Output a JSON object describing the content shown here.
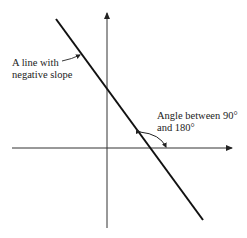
{
  "diagram": {
    "type": "coordinate-axes-with-line",
    "labels": {
      "line_label_1": "A line with",
      "line_label_2": "negative slope",
      "angle_label_1": "Angle between 90°",
      "angle_label_2": "and 180°"
    },
    "colors": {
      "ink": "#222222",
      "axis": "#333333",
      "background": "#ffffff"
    }
  }
}
